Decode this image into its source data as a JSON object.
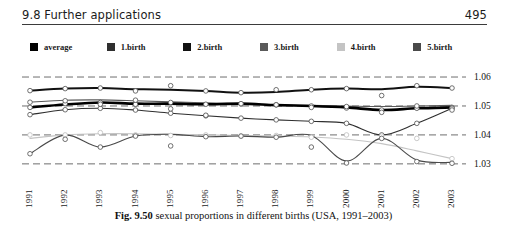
{
  "header": {
    "section_title": "9.8 Further applications",
    "page_number": "495"
  },
  "legend": {
    "items": [
      {
        "label": "average",
        "color": "#000000"
      },
      {
        "label": "1.birth",
        "color": "#2f2f2f"
      },
      {
        "label": "2.birth",
        "color": "#111111"
      },
      {
        "label": "3.birth",
        "color": "#5a5a5a"
      },
      {
        "label": "4.birth",
        "color": "#c4c4c4"
      },
      {
        "label": "5.birth",
        "color": "#4a4a4a"
      }
    ]
  },
  "caption": {
    "figure_number": "Fig. 9.50",
    "text": "sexual proportions in different births (USA, 1991–2003)"
  },
  "chart_data": {
    "type": "line",
    "title": "sexual proportions in different births (USA, 1991–2003)",
    "xlabel": "",
    "ylabel": "",
    "x": [
      1991,
      1992,
      1993,
      1994,
      1995,
      1996,
      1997,
      1998,
      1999,
      2000,
      2001,
      2002,
      2003
    ],
    "categories": [
      "1991",
      "1992",
      "1993",
      "1994",
      "1995",
      "1996",
      "1997",
      "1998",
      "1999",
      "2000",
      "2001",
      "2002",
      "2003"
    ],
    "ylim": [
      1.0265,
      1.0645
    ],
    "yticks": [
      1.06,
      1.05,
      1.04,
      1.03
    ],
    "ytick_labels": [
      "1.06",
      "1.05",
      "1.04",
      "1.03"
    ],
    "grid": "horizontal-dashed",
    "legend_position": "top",
    "markers": "open-circle",
    "series": [
      {
        "name": "average",
        "color": "#000000",
        "width": 2.6,
        "values": [
          1.0495,
          1.0505,
          1.0512,
          1.0508,
          1.0508,
          1.0506,
          1.0508,
          1.0503,
          1.05,
          1.0495,
          1.0486,
          1.0492,
          1.0495
        ]
      },
      {
        "name": "1.birth",
        "color": "#2f2f2f",
        "width": 1.1,
        "values": [
          1.047,
          1.0487,
          1.0492,
          1.0486,
          1.0475,
          1.0466,
          1.0458,
          1.0452,
          1.0447,
          1.044,
          1.04,
          1.044,
          1.0492
        ]
      },
      {
        "name": "2.birth",
        "color": "#111111",
        "width": 2.0,
        "values": [
          1.0553,
          1.056,
          1.0562,
          1.0558,
          1.0556,
          1.0552,
          1.0546,
          1.0548,
          1.0556,
          1.056,
          1.0558,
          1.0566,
          1.0562
        ]
      },
      {
        "name": "3.birth",
        "color": "#5a5a5a",
        "width": 1.1,
        "values": [
          1.0513,
          1.052,
          1.0521,
          1.0518,
          1.0514,
          1.0511,
          1.0508,
          1.0504,
          1.0502,
          1.05,
          1.0498,
          1.05,
          1.0502
        ]
      },
      {
        "name": "4.birth",
        "color": "#c4c4c4",
        "width": 1.1,
        "values": [
          1.0388,
          1.04,
          1.0404,
          1.0404,
          1.0402,
          1.04,
          1.0398,
          1.0396,
          1.0393,
          1.0385,
          1.037,
          1.0345,
          1.0318
        ]
      },
      {
        "name": "5.birth",
        "color": "#4a4a4a",
        "width": 1.1,
        "values": [
          1.0335,
          1.04,
          1.0358,
          1.0396,
          1.0402,
          1.0394,
          1.0396,
          1.0392,
          1.0398,
          1.031,
          1.0388,
          1.0313,
          1.0305
        ]
      }
    ],
    "scatter_points": [
      {
        "series": "average",
        "x": 1991,
        "y": 1.0495
      },
      {
        "series": "average",
        "x": 1992,
        "y": 1.0508
      },
      {
        "series": "average",
        "x": 1993,
        "y": 1.0512
      },
      {
        "series": "average",
        "x": 1994,
        "y": 1.0506
      },
      {
        "series": "average",
        "x": 1995,
        "y": 1.0512
      },
      {
        "series": "average",
        "x": 1996,
        "y": 1.0506
      },
      {
        "series": "average",
        "x": 1997,
        "y": 1.0507
      },
      {
        "series": "average",
        "x": 1998,
        "y": 1.0504
      },
      {
        "series": "average",
        "x": 1999,
        "y": 1.05
      },
      {
        "series": "average",
        "x": 2000,
        "y": 1.0493
      },
      {
        "series": "average",
        "x": 2001,
        "y": 1.0486
      },
      {
        "series": "average",
        "x": 2002,
        "y": 1.0492
      },
      {
        "series": "average",
        "x": 2003,
        "y": 1.0495
      },
      {
        "series": "1.birth",
        "x": 1991,
        "y": 1.047
      },
      {
        "series": "1.birth",
        "x": 1992,
        "y": 1.0487
      },
      {
        "series": "1.birth",
        "x": 1993,
        "y": 1.0492
      },
      {
        "series": "1.birth",
        "x": 1994,
        "y": 1.0486
      },
      {
        "series": "1.birth",
        "x": 1995,
        "y": 1.0475
      },
      {
        "series": "1.birth",
        "x": 1996,
        "y": 1.0466
      },
      {
        "series": "1.birth",
        "x": 1997,
        "y": 1.0458
      },
      {
        "series": "1.birth",
        "x": 1998,
        "y": 1.0452
      },
      {
        "series": "1.birth",
        "x": 1999,
        "y": 1.0447
      },
      {
        "series": "1.birth",
        "x": 2000,
        "y": 1.044
      },
      {
        "series": "1.birth",
        "x": 2001,
        "y": 1.04
      },
      {
        "series": "1.birth",
        "x": 2002,
        "y": 1.044
      },
      {
        "series": "1.birth",
        "x": 2003,
        "y": 1.0492
      },
      {
        "series": "2.birth",
        "x": 1991,
        "y": 1.0553
      },
      {
        "series": "2.birth",
        "x": 1992,
        "y": 1.056
      },
      {
        "series": "2.birth",
        "x": 1993,
        "y": 1.0562
      },
      {
        "series": "2.birth",
        "x": 1994,
        "y": 1.0552
      },
      {
        "series": "2.birth",
        "x": 1995,
        "y": 1.057
      },
      {
        "series": "2.birth",
        "x": 1996,
        "y": 1.0552
      },
      {
        "series": "2.birth",
        "x": 1997,
        "y": 1.0546
      },
      {
        "series": "2.birth",
        "x": 1998,
        "y": 1.0556
      },
      {
        "series": "2.birth",
        "x": 1999,
        "y": 1.0556
      },
      {
        "series": "2.birth",
        "x": 2000,
        "y": 1.056
      },
      {
        "series": "2.birth",
        "x": 2001,
        "y": 1.0536
      },
      {
        "series": "2.birth",
        "x": 2002,
        "y": 1.057
      },
      {
        "series": "2.birth",
        "x": 2003,
        "y": 1.0562
      },
      {
        "series": "3.birth",
        "x": 1991,
        "y": 1.0513
      },
      {
        "series": "3.birth",
        "x": 1992,
        "y": 1.0518
      },
      {
        "series": "3.birth",
        "x": 1993,
        "y": 1.0506
      },
      {
        "series": "3.birth",
        "x": 1994,
        "y": 1.052
      },
      {
        "series": "3.birth",
        "x": 1995,
        "y": 1.049
      },
      {
        "series": "3.birth",
        "x": 1996,
        "y": 1.0468
      },
      {
        "series": "3.birth",
        "x": 1997,
        "y": 1.0508
      },
      {
        "series": "3.birth",
        "x": 1998,
        "y": 1.0504
      },
      {
        "series": "3.birth",
        "x": 1999,
        "y": 1.0495
      },
      {
        "series": "3.birth",
        "x": 2000,
        "y": 1.0498
      },
      {
        "series": "3.birth",
        "x": 2001,
        "y": 1.0478
      },
      {
        "series": "3.birth",
        "x": 2002,
        "y": 1.05
      },
      {
        "series": "3.birth",
        "x": 2003,
        "y": 1.0486
      },
      {
        "series": "4.birth",
        "x": 1991,
        "y": 1.04
      },
      {
        "series": "4.birth",
        "x": 1992,
        "y": 1.04
      },
      {
        "series": "4.birth",
        "x": 1993,
        "y": 1.0408
      },
      {
        "series": "4.birth",
        "x": 1994,
        "y": 1.04
      },
      {
        "series": "4.birth",
        "x": 1995,
        "y": 1.0398
      },
      {
        "series": "4.birth",
        "x": 1996,
        "y": 1.04
      },
      {
        "series": "4.birth",
        "x": 1997,
        "y": 1.0396
      },
      {
        "series": "4.birth",
        "x": 1998,
        "y": 1.0398
      },
      {
        "series": "4.birth",
        "x": 1999,
        "y": 1.0392
      },
      {
        "series": "4.birth",
        "x": 2000,
        "y": 1.04
      },
      {
        "series": "4.birth",
        "x": 2001,
        "y": 1.0396
      },
      {
        "series": "4.birth",
        "x": 2002,
        "y": 1.0388
      },
      {
        "series": "4.birth",
        "x": 2003,
        "y": 1.0318
      },
      {
        "series": "5.birth",
        "x": 1991,
        "y": 1.0335
      },
      {
        "series": "5.birth",
        "x": 1992,
        "y": 1.0385
      },
      {
        "series": "5.birth",
        "x": 1993,
        "y": 1.0358
      },
      {
        "series": "5.birth",
        "x": 1994,
        "y": 1.0396
      },
      {
        "series": "5.birth",
        "x": 1995,
        "y": 1.0362
      },
      {
        "series": "5.birth",
        "x": 1996,
        "y": 1.0394
      },
      {
        "series": "5.birth",
        "x": 1997,
        "y": 1.0396
      },
      {
        "series": "5.birth",
        "x": 1998,
        "y": 1.0392
      },
      {
        "series": "5.birth",
        "x": 1999,
        "y": 1.0358
      },
      {
        "series": "5.birth",
        "x": 2000,
        "y": 1.0303
      },
      {
        "series": "5.birth",
        "x": 2001,
        "y": 1.0388
      },
      {
        "series": "5.birth",
        "x": 2002,
        "y": 1.0308
      },
      {
        "series": "5.birth",
        "x": 2003,
        "y": 1.0302
      }
    ]
  }
}
